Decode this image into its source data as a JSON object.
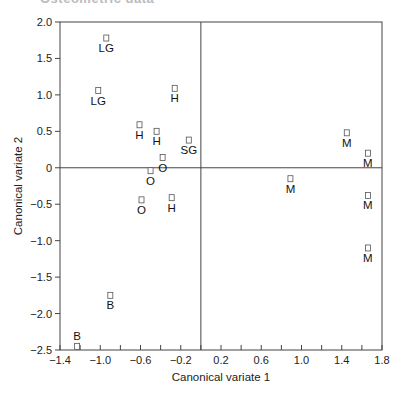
{
  "header": {
    "clipped_title": "Osteometric data"
  },
  "chart_data": {
    "type": "scatter",
    "title": "",
    "xlabel": "Canonical variate 1",
    "ylabel": "Canonical variate 2",
    "xlim": [
      -1.4,
      1.8
    ],
    "ylim": [
      -2.5,
      2.0
    ],
    "x_ticks": [
      -1.4,
      -1.0,
      -0.6,
      -0.2,
      0.2,
      0.6,
      1.0,
      1.4,
      1.8
    ],
    "x_tick_labels": [
      "−1.4",
      "−1.0",
      "−0.6",
      "−0.2",
      "0.2",
      "0.6",
      "1.0",
      "1.4",
      "1.8"
    ],
    "x_minor_step": 0.2,
    "y_ticks": [
      2.0,
      1.5,
      1.0,
      0.5,
      0,
      -0.5,
      -1.0,
      -1.5,
      -2.0,
      -2.5
    ],
    "y_tick_labels": [
      "2.0",
      "1.5",
      "1.0",
      "0.5",
      "0",
      "−0.5",
      "−1.0",
      "−1.5",
      "−2.0",
      "−2.5"
    ],
    "grid": false,
    "reference_lines": {
      "x": 0,
      "y": 0
    },
    "legend": null,
    "marker": "open-square",
    "points": [
      {
        "label": "LG",
        "x": -0.94,
        "y": 1.78,
        "label_pos": "below"
      },
      {
        "label": "LG",
        "x": -1.02,
        "y": 1.06,
        "label_pos": "below"
      },
      {
        "label": "H",
        "x": -0.26,
        "y": 1.09,
        "label_pos": "below"
      },
      {
        "label": "H",
        "x": -0.61,
        "y": 0.59,
        "label_pos": "below"
      },
      {
        "label": "H",
        "x": -0.44,
        "y": 0.5,
        "label_pos": "below"
      },
      {
        "label": "SG",
        "x": -0.12,
        "y": 0.38,
        "label_pos": "below"
      },
      {
        "label": "O",
        "x": -0.38,
        "y": 0.14,
        "label_pos": "below"
      },
      {
        "label": "O",
        "x": -0.5,
        "y": -0.04,
        "label_pos": "below"
      },
      {
        "label": "O",
        "x": -0.59,
        "y": -0.44,
        "label_pos": "below"
      },
      {
        "label": "H",
        "x": -0.29,
        "y": -0.41,
        "label_pos": "below"
      },
      {
        "label": "M",
        "x": 1.45,
        "y": 0.48,
        "label_pos": "below"
      },
      {
        "label": "M",
        "x": 1.66,
        "y": 0.2,
        "label_pos": "below"
      },
      {
        "label": "M",
        "x": 0.89,
        "y": -0.15,
        "label_pos": "below"
      },
      {
        "label": "M",
        "x": 1.66,
        "y": -0.38,
        "label_pos": "below"
      },
      {
        "label": "M",
        "x": 1.66,
        "y": -1.1,
        "label_pos": "below"
      },
      {
        "label": "B",
        "x": -0.9,
        "y": -1.75,
        "label_pos": "below"
      },
      {
        "label": "B",
        "x": -1.23,
        "y": -2.45,
        "label_pos": "above"
      }
    ],
    "colors": {
      "axis": "#444444",
      "marker": "#555555",
      "text": "#222222"
    }
  }
}
